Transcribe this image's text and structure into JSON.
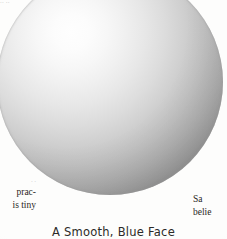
{
  "figure": {
    "name": "shaded-sphere",
    "caption": "A Smooth, Blue Face",
    "shape": "sphere",
    "highlight_position": "upper-left",
    "colors": {
      "highlight": "#fefefe",
      "midtone": "#c0c0c0",
      "terminator": "#6a6a6a",
      "paper": "#fdfdfc",
      "ink": "#24221f"
    }
  },
  "page": {
    "corner_scrap": "·· ··",
    "left_column": {
      "scrap": "·  ·",
      "lines": [
        "prac-",
        "is tiny"
      ]
    },
    "right_column": {
      "lines": [
        "Sa",
        "belie"
      ]
    }
  }
}
